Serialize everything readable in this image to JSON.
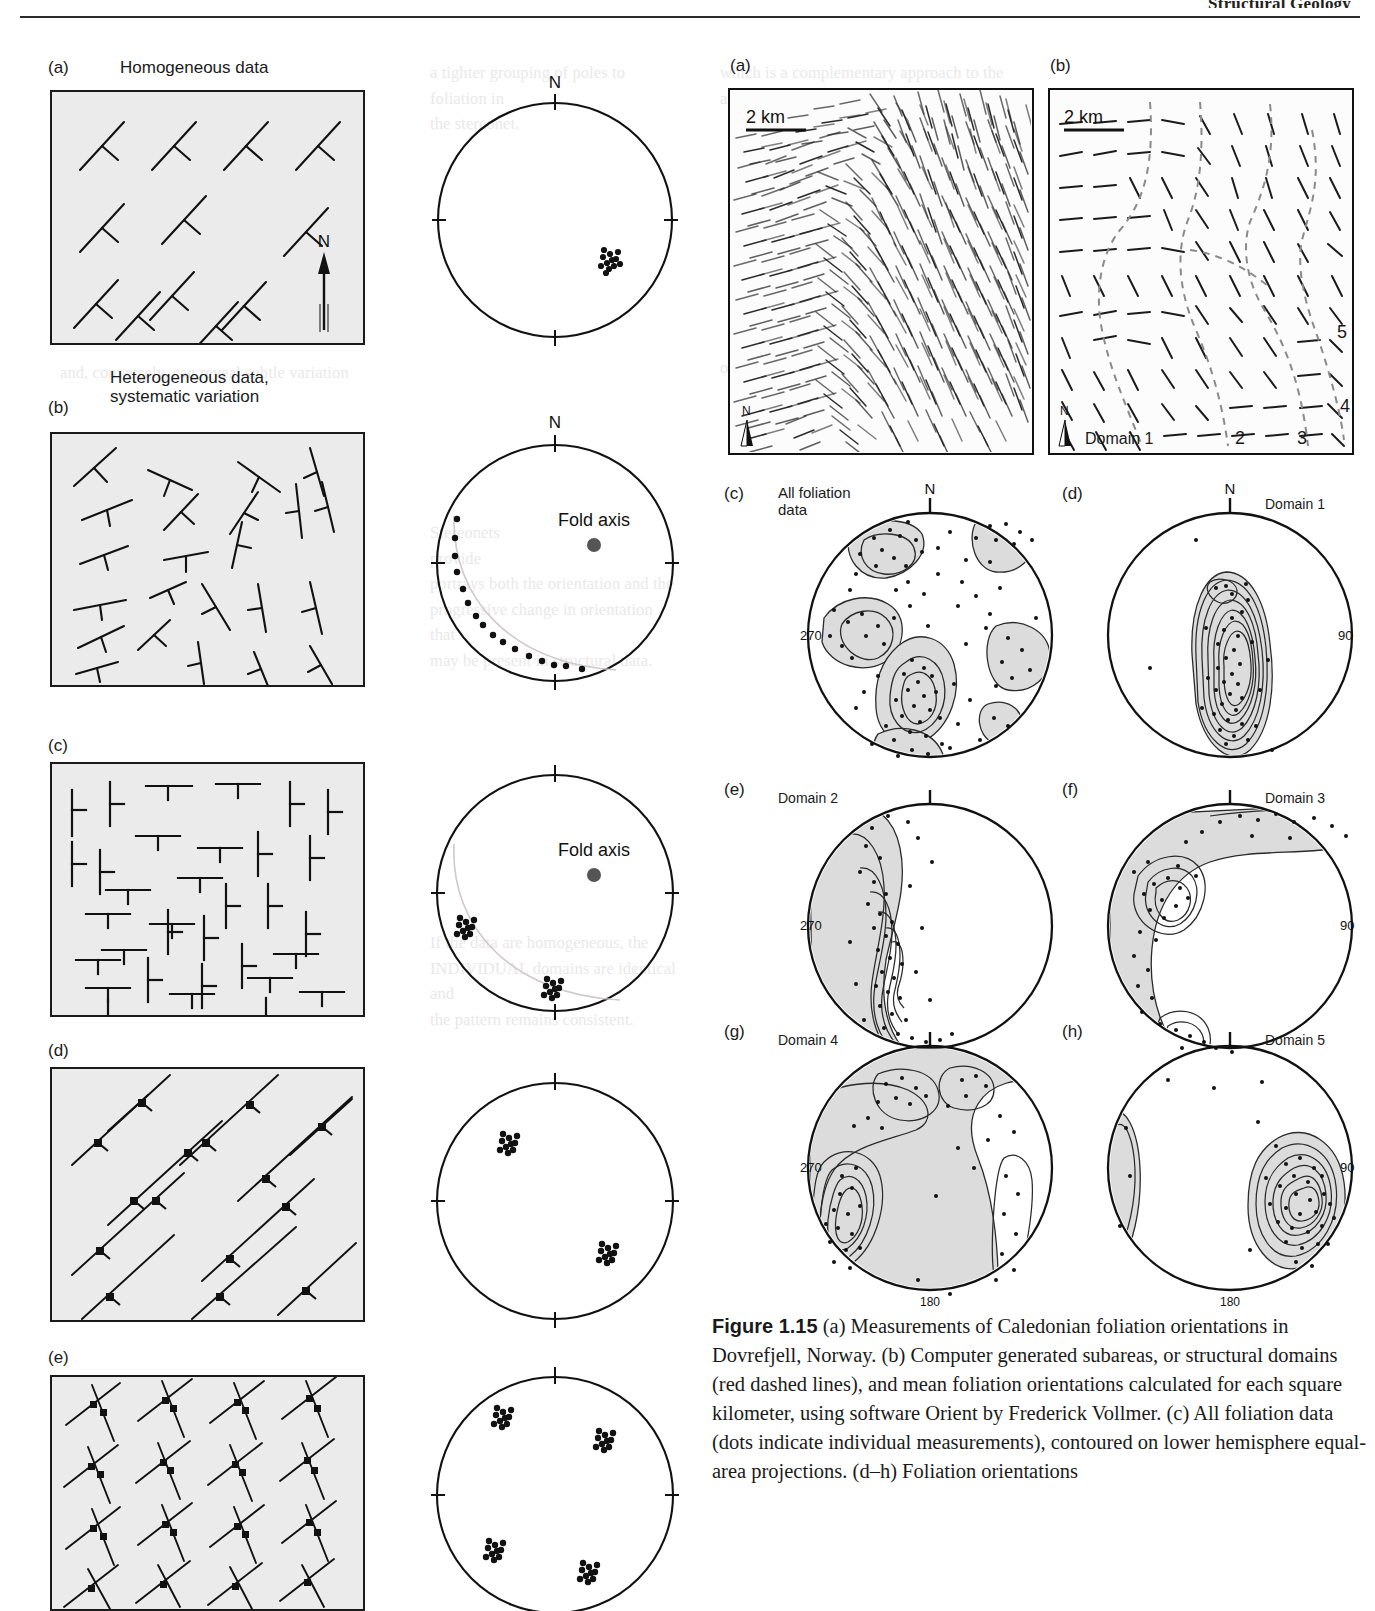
{
  "header": {
    "running_head": "Structural Geology",
    "rule_color": "#2b2b2b"
  },
  "left_figure": {
    "panels": [
      {
        "key": "a",
        "label": "(a)",
        "title": "Homogeneous data"
      },
      {
        "key": "b",
        "label": "(b)",
        "title": "Heterogeneous data,\nsystematic variation"
      },
      {
        "key": "c",
        "label": "(c)",
        "title": ""
      },
      {
        "key": "d",
        "label": "(d)",
        "title": ""
      },
      {
        "key": "e",
        "label": "(e)",
        "title": ""
      }
    ],
    "compass_label": "N",
    "stereonet_north_label": "N",
    "fold_axis_label": "Fold axis"
  },
  "right_figure": {
    "map_a": {
      "label": "(a)",
      "scale_bar": "2 km",
      "north_label": "N"
    },
    "map_b": {
      "label": "(b)",
      "scale_bar": "2 km",
      "north_label": "N",
      "domain_label": "Domain 1",
      "domain_numbers": [
        "2",
        "3",
        "4",
        "5"
      ]
    },
    "stereonets": [
      {
        "label": "(c)",
        "title": "All foliation\ndata",
        "north": "N",
        "west": "270",
        "east": "",
        "south": ""
      },
      {
        "label": "(d)",
        "title": "Domain 1",
        "north": "N",
        "west": "",
        "east": "90",
        "south": ""
      },
      {
        "label": "(e)",
        "title": "Domain 2",
        "north": "",
        "west": "270",
        "east": "",
        "south": ""
      },
      {
        "label": "(f)",
        "title": "Domain 3",
        "north": "",
        "west": "",
        "east": "90",
        "south": ""
      },
      {
        "label": "(g)",
        "title": "Domain 4",
        "north": "",
        "west": "270",
        "east": "",
        "south": "180"
      },
      {
        "label": "(h)",
        "title": "Domain 5",
        "north": "",
        "west": "",
        "east": "90",
        "south": "180"
      }
    ]
  },
  "caption": {
    "figure_number": "Figure 1.15",
    "text": " (a) Measurements of Caledonian foliation orientations in Dovrefjell, Norway. (b) Computer generated subareas, or structural domains (red dashed lines), and mean foliation orientations calculated for each square kilometer, using software Orient by Frederick Vollmer. (c) All foliation data (dots indicate individual measurements), contoured on lower hemisphere equal-area projections. (d–h) Foliation orientations"
  },
  "ghost_text": {
    "col_left_1": "a tighter grouping of poles to foliation in\nthe stereonet.",
    "col_left_2": "and, conversely, can reveal subtle variation",
    "col_left_3": "Stereonets\nprovide\nportrays both the orientation and the\nprogressive change in orientation that\nmay be present in structural data.",
    "col_left_4": "If the data are homogeneous, the\nINDIVIDUAL domains are identical and\nthe pattern remains consistent.",
    "col_right_1": "which is a complementary approach to the\nanalysis of structures.",
    "col_right_2": "of structural domains within the map area"
  }
}
